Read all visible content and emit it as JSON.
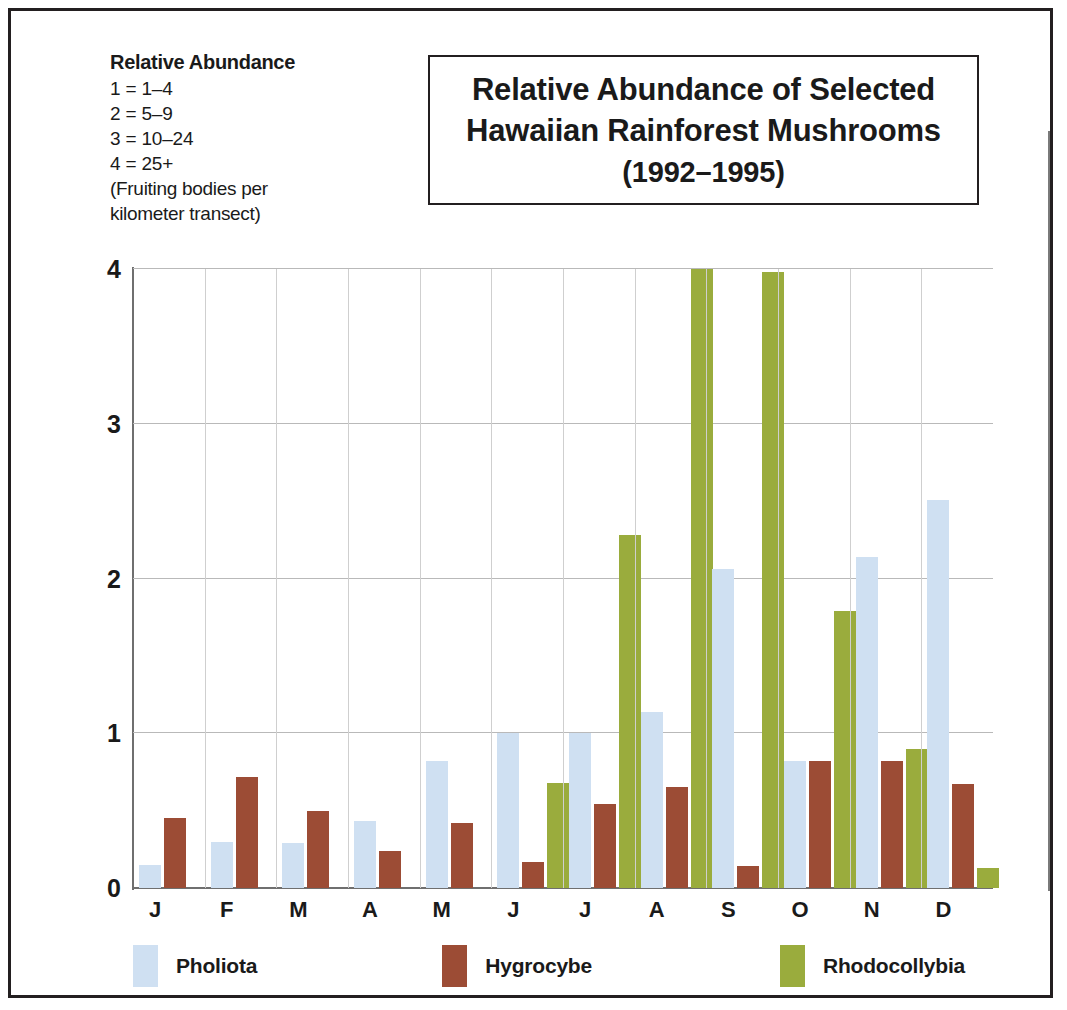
{
  "key": {
    "title": "Relative Abundance",
    "lines": [
      "1 = 1–4",
      "2 = 5–9",
      "3 = 10–24",
      "4 = 25+"
    ],
    "note_line1": "(Fruiting bodies per",
    "note_line2": "kilometer transect)"
  },
  "title_box": {
    "line1": "Relative Abundance of Selected",
    "line2": "Hawaiian Rainforest Mushrooms",
    "line3": "(1992–1995)"
  },
  "colors": {
    "pholiota": "#cfe0f2",
    "hygrocybe": "#9c4c35",
    "rhodocollybia": "#9aac3d",
    "axis": "#6f6f6f",
    "grid": "#b9b9b9",
    "frame": "#231f20"
  },
  "chart_data": {
    "type": "bar",
    "title": "Relative Abundance of Selected Hawaiian Rainforest Mushrooms (1992–1995)",
    "xlabel": "",
    "ylabel": "Relative Abundance",
    "ylim": [
      0,
      4
    ],
    "yticks": [
      0,
      1,
      2,
      3,
      4
    ],
    "ytick_labels": [
      "0",
      "1",
      "2",
      "3",
      "4"
    ],
    "grid": true,
    "legend_position": "bottom-left",
    "categories": [
      "J",
      "F",
      "M",
      "A",
      "M",
      "J",
      "J",
      "A",
      "S",
      "O",
      "N",
      "D"
    ],
    "category_full": [
      "January",
      "February",
      "March",
      "April",
      "May",
      "June",
      "July",
      "August",
      "September",
      "October",
      "November",
      "December"
    ],
    "series": [
      {
        "name": "Pholiota",
        "color": "#cfe0f2",
        "values": [
          0.15,
          0.3,
          0.29,
          0.43,
          0.82,
          1.0,
          1.0,
          1.14,
          2.06,
          0.82,
          2.14,
          2.51
        ]
      },
      {
        "name": "Hygrocybe",
        "color": "#9c4c35",
        "values": [
          0.45,
          0.72,
          0.5,
          0.24,
          0.42,
          0.17,
          0.54,
          0.65,
          0.14,
          0.82,
          0.82,
          0.67
        ]
      },
      {
        "name": "Rhodocollybia",
        "color": "#9aac3d",
        "values": [
          0,
          0,
          0,
          0,
          0,
          0.68,
          2.28,
          4.0,
          3.98,
          1.79,
          0.9,
          0.13
        ]
      }
    ]
  },
  "legend": [
    {
      "label": "Pholiota",
      "swatch": "pholiota"
    },
    {
      "label": "Hygrocybe",
      "swatch": "hygrocybe"
    },
    {
      "label": "Rhodocollybia",
      "swatch": "rhodo"
    }
  ]
}
